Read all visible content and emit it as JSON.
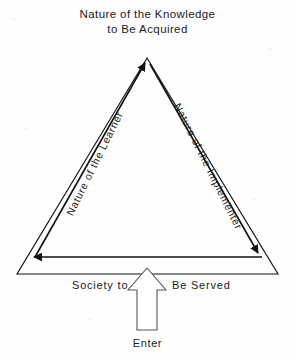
{
  "diagram": {
    "title_lines": [
      "Nature of the Knowledge",
      "to Be Acquired"
    ],
    "apex_label": "Nature of the Knowledge to Be Acquired",
    "left_edge_label": "Nature of the Learner",
    "right_edge_label": "Nature of the Implementer",
    "base_label_left": "Society to",
    "base_label_right": "Be Served",
    "base_label_full": "Society to Be Served",
    "entry_label": "Enter",
    "stroke_color": "#111111",
    "background_color": "#fefefe"
  }
}
